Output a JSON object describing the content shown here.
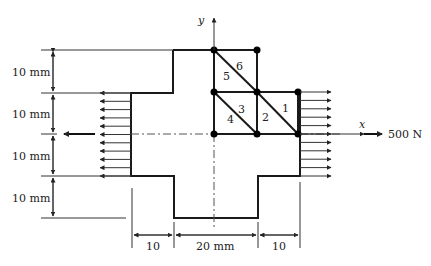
{
  "figure": {
    "type": "finite-element plate diagram",
    "axes": {
      "x_label": "x",
      "y_label": "y"
    },
    "load": {
      "label": "500 N",
      "direction": "horizontal tension (left and right edges)"
    },
    "dimensions": {
      "vertical": [
        "10 mm",
        "10 mm",
        "10 mm",
        "10 mm"
      ],
      "horizontal": [
        "10",
        "20 mm",
        "10"
      ]
    },
    "elements": [
      {
        "id": "1",
        "label": "1"
      },
      {
        "id": "2",
        "label": "2"
      },
      {
        "id": "3",
        "label": "3"
      },
      {
        "id": "4",
        "label": "4"
      },
      {
        "id": "5",
        "label": "5"
      },
      {
        "id": "6",
        "label": "6"
      }
    ],
    "nodes_count": 8,
    "left_arrow_count": 11,
    "right_arrow_count": 11
  }
}
